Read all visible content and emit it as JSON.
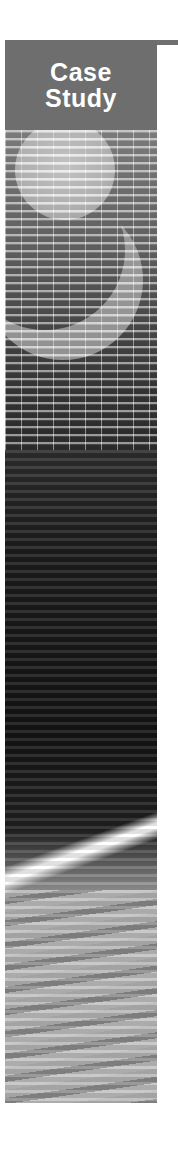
{
  "banner": {
    "title_line1": "Case",
    "title_line2": "Study",
    "title_bg_color": "#6e6e6e",
    "title_text_color": "#ffffff",
    "image_description": "decorative grayscale abstract image: grid lines, moon/crescent shape, dark horizontal streaks, bright diagonal light beam"
  }
}
